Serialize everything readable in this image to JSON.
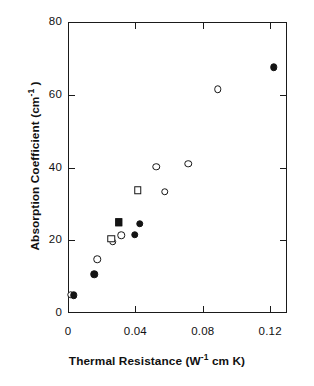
{
  "chart_data": {
    "type": "scatter",
    "title": "",
    "xlabel": "Thermal Resistance (W-1 cm K)",
    "xlabel_parts": {
      "pre": "Thermal Resistance (W",
      "sup": "-1",
      "post": " cm K)"
    },
    "ylabel": "Absorption Coefficient (cm-1 )",
    "ylabel_parts": {
      "pre": "Absorption Coefficient (cm",
      "sup": "-1",
      "post": " )"
    },
    "xlim": [
      0,
      0.13
    ],
    "ylim": [
      0,
      80
    ],
    "xticks": [
      0,
      0.04,
      0.08,
      0.12
    ],
    "xticklabels": [
      "0",
      "0.04",
      "0.08",
      "0.12"
    ],
    "yticks": [
      0,
      20,
      40,
      60,
      80
    ],
    "yticklabels": [
      "0",
      "20",
      "40",
      "60",
      "80"
    ],
    "grid": false,
    "legend": "none",
    "marker_color": "#141414",
    "axis_color": "#1a1a1a",
    "background": "#ffffff",
    "series": [
      {
        "name": "open circles",
        "marker": "circle-open",
        "points": [
          {
            "x": 0.0015,
            "y": 5.0
          },
          {
            "x": 0.0175,
            "y": 14.8
          },
          {
            "x": 0.0265,
            "y": 19.6
          },
          {
            "x": 0.0315,
            "y": 21.4
          },
          {
            "x": 0.0525,
            "y": 40.2
          },
          {
            "x": 0.0575,
            "y": 33.3
          },
          {
            "x": 0.0715,
            "y": 41.0
          },
          {
            "x": 0.089,
            "y": 61.5
          }
        ]
      },
      {
        "name": "filled circles",
        "marker": "circle-filled",
        "points": [
          {
            "x": 0.0035,
            "y": 4.9
          },
          {
            "x": 0.0155,
            "y": 10.6
          },
          {
            "x": 0.0395,
            "y": 21.5
          },
          {
            "x": 0.0425,
            "y": 24.5
          },
          {
            "x": 0.122,
            "y": 67.5
          }
        ]
      },
      {
        "name": "open squares",
        "marker": "square-open",
        "points": [
          {
            "x": 0.0258,
            "y": 20.4
          },
          {
            "x": 0.0415,
            "y": 33.8
          }
        ]
      },
      {
        "name": "filled squares",
        "marker": "square-filled",
        "points": [
          {
            "x": 0.03,
            "y": 25.0
          }
        ]
      }
    ]
  }
}
